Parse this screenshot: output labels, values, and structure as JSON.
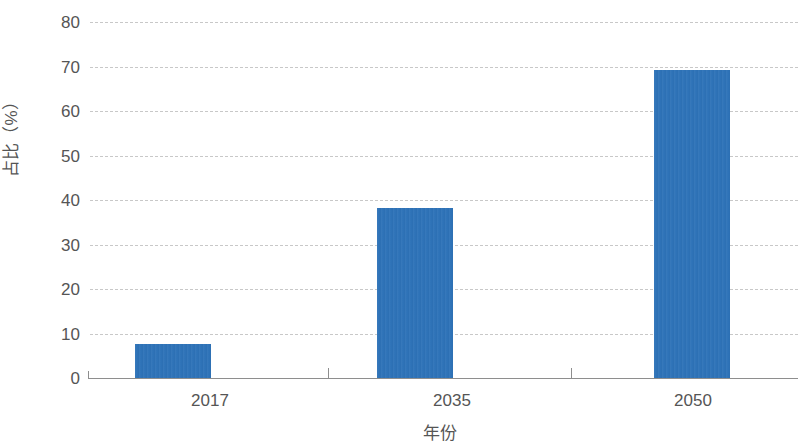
{
  "chart_data": {
    "type": "bar",
    "title": "",
    "subtitle": "",
    "categories": [
      "2017",
      "2035",
      "2050"
    ],
    "values": [
      7.6,
      38.3,
      69.3
    ],
    "series": [
      {
        "name": "占比",
        "values": [
          7.6,
          38.3,
          69.3
        ]
      }
    ],
    "xlabel": "年份",
    "ylabel": "占比（%）",
    "ylim": [
      0,
      80
    ],
    "yticks": [
      0,
      10,
      20,
      30,
      40,
      50,
      60,
      70,
      80
    ],
    "ytick_labels": [
      "0",
      "10",
      "20",
      "30",
      "40",
      "50",
      "60",
      "70",
      "80"
    ],
    "grid": true,
    "grid_axis": "y",
    "grid_style": "dashed",
    "legend": false,
    "legend_position": "none",
    "bar_color": "#2e73b8",
    "grid_color": "#c8c8c8",
    "axis_color": "#8e8e8e",
    "text_color": "#555555"
  }
}
